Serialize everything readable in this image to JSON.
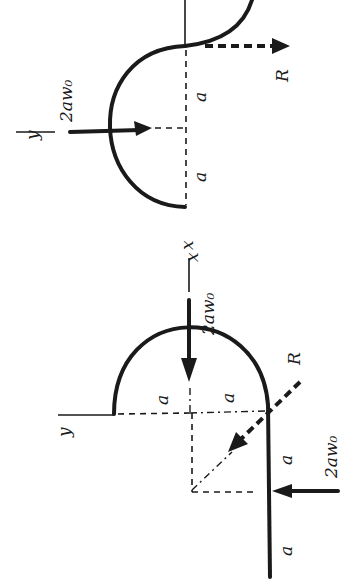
{
  "figure": {
    "orientation": "rotated 90 degrees clockwise",
    "colors": {
      "ink": "#1a1a1a",
      "background": "#ffffff"
    },
    "top_diagram": {
      "axis_labels": {
        "x": "x",
        "y": "y"
      },
      "load_label": "2aw₀",
      "reaction_label": "R",
      "dimension_labels": [
        "a",
        "a"
      ]
    },
    "bottom_diagram": {
      "axis_labels": {
        "x": "x",
        "y": "y"
      },
      "load_label_top": "2aw₀",
      "load_label_side": "2aw₀",
      "reaction_label": "R",
      "dimension_labels": [
        "a",
        "a",
        "a",
        "a"
      ]
    }
  }
}
